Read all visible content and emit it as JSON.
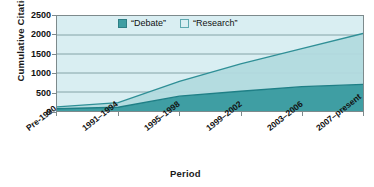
{
  "chart_data": {
    "type": "area",
    "title": "",
    "subtitle": "",
    "xlabel": "Period",
    "ylabel": "Cumulative Citations",
    "categories": [
      "Pre-1990",
      "1991–1994",
      "1995–1998",
      "1999–2002",
      "2003–2006",
      "2007–present"
    ],
    "ylim": [
      0,
      2500
    ],
    "yticks": [
      0,
      500,
      1000,
      1500,
      2000,
      2500
    ],
    "grid": true,
    "stacked": true,
    "legend_position": "top-center",
    "series": [
      {
        "name": "“Debate”",
        "color": "#3f9ea3",
        "values": [
          60,
          100,
          390,
          520,
          640,
          700
        ]
      },
      {
        "name": "“Research”",
        "color": "#b9dfe4",
        "values": [
          50,
          120,
          390,
          720,
          1000,
          1340
        ]
      }
    ],
    "cumulative_totals": [
      110,
      220,
      780,
      1240,
      1640,
      2040
    ]
  },
  "legend": {
    "items": [
      {
        "label": "“Debate”",
        "color": "#3f9ea3"
      },
      {
        "label": "“Research”",
        "color": "#b9dfe4"
      }
    ]
  },
  "axes": {
    "y_title": "Cumulative Citations",
    "x_title": "Period",
    "y_tick_labels": [
      "2500",
      "2000",
      "1500",
      "1000",
      "500",
      "0"
    ],
    "x_tick_labels": [
      "Pre-1990",
      "1991–1994",
      "1995–1998",
      "1999–2002",
      "2003–2006",
      "2007–present"
    ]
  },
  "colors": {
    "debate": "#3f9ea3",
    "research": "#b9dfe4",
    "plot_background": "#d9eef2",
    "grid": "#6f8f93",
    "axis": "#7d8a8c",
    "text": "#111111"
  }
}
